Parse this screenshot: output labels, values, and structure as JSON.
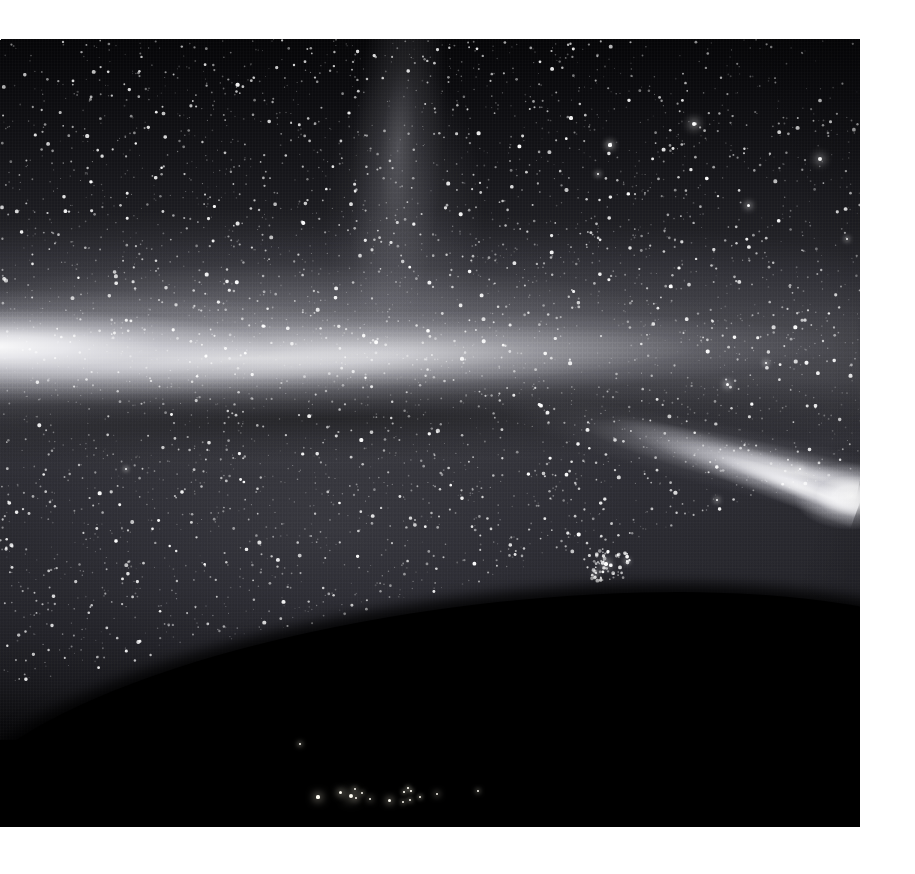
{
  "page": {
    "width": 915,
    "height": 874,
    "background": "#ffffff"
  },
  "photo": {
    "name": "all-sky-night-exposure",
    "x": 0,
    "y": 39,
    "width": 860,
    "height": 788,
    "alt_text": "Wide-angle all-sky night exposure showing the Milky Way band, airglow and a dark curved horizon with distant ground lights",
    "palette": {
      "paper": "#ffffff",
      "sky_zenith": "#050507",
      "sky_mid": "#2b2b31",
      "band_core": "#fafafc",
      "band_mid": "#c4c4ca",
      "dark_lane": "#14141a",
      "ground": "#000000",
      "star": "#ffffff",
      "ground_light": "#fffdf4"
    }
  },
  "features": [
    {
      "name": "milky-way-band",
      "label": "Milky Way luminous band",
      "description": "Broad bright band sweeping from the left edge across the frame and converging toward the right edge",
      "center_x_pct": 28,
      "center_y_pct": 40,
      "tilt_deg": -1.4
    },
    {
      "name": "milky-way-right-arm",
      "label": "Converging right arm",
      "description": "Narrow luminous arm descending toward a bright knot at the right edge",
      "center_x_pct": 92,
      "center_y_pct": 55,
      "tilt_deg": 13
    },
    {
      "name": "galactic-spur",
      "label": "Faint vertical galactic spur",
      "description": "Dim vertical extension of diffuse light rising toward the top of the frame",
      "center_x_pct": 44,
      "center_y_pct": 14
    },
    {
      "name": "dark-dust-lane",
      "label": "Dark dust lane",
      "description": "Darker band immediately below the bright core",
      "center_x_pct": 38,
      "center_y_pct": 48
    },
    {
      "name": "horizon-curve",
      "label": "Curved dark horizon",
      "description": "Black foreground terrain curving upward to the right, occluding the lower sky",
      "tilt_deg": -7.2
    },
    {
      "name": "star-cluster",
      "label": "Open star cluster",
      "description": "Compact knot of stars in the lower-middle sky",
      "center_x": 606,
      "center_y": 525
    }
  ],
  "bright_stars": [
    {
      "x": 694,
      "y": 85,
      "size": 4.5,
      "glow": 9
    },
    {
      "x": 820,
      "y": 120,
      "size": 4.0,
      "glow": 8
    },
    {
      "x": 748,
      "y": 166,
      "size": 3.0,
      "glow": 6
    },
    {
      "x": 610,
      "y": 106,
      "size": 3.2,
      "glow": 6
    },
    {
      "x": 847,
      "y": 200,
      "size": 2.6,
      "glow": 5
    },
    {
      "x": 598,
      "y": 135,
      "size": 2.4,
      "glow": 5
    },
    {
      "x": 727,
      "y": 345,
      "size": 3.0,
      "glow": 6
    },
    {
      "x": 766,
      "y": 324,
      "size": 2.6,
      "glow": 5
    },
    {
      "x": 800,
      "y": 430,
      "size": 2.8,
      "glow": 6
    },
    {
      "x": 717,
      "y": 461,
      "size": 2.6,
      "glow": 5
    },
    {
      "x": 606,
      "y": 525,
      "size": 3.4,
      "glow": 7
    },
    {
      "x": 627,
      "y": 522,
      "size": 2.4,
      "glow": 5
    },
    {
      "x": 596,
      "y": 534,
      "size": 2.4,
      "glow": 5
    },
    {
      "x": 556,
      "y": 600,
      "size": 2.4,
      "glow": 5
    },
    {
      "x": 684,
      "y": 574,
      "size": 2.2,
      "glow": 4
    },
    {
      "x": 742,
      "y": 586,
      "size": 2.2,
      "glow": 4
    },
    {
      "x": 287,
      "y": 648,
      "size": 2.0,
      "glow": 4
    },
    {
      "x": 126,
      "y": 430,
      "size": 2.2,
      "glow": 4
    },
    {
      "x": 196,
      "y": 700,
      "size": 2.0,
      "glow": 4
    },
    {
      "x": 400,
      "y": 743,
      "size": 2.2,
      "glow": 5
    },
    {
      "x": 303,
      "y": 743,
      "size": 2.0,
      "glow": 4
    }
  ],
  "ground_lights": [
    {
      "x": 318,
      "y": 797,
      "size": 3.2
    },
    {
      "x": 340,
      "y": 792,
      "size": 3.0
    },
    {
      "x": 351,
      "y": 796,
      "size": 4.0
    },
    {
      "x": 356,
      "y": 798,
      "size": 2.4
    },
    {
      "x": 362,
      "y": 793,
      "size": 2.0
    },
    {
      "x": 370,
      "y": 799,
      "size": 2.6
    },
    {
      "x": 389,
      "y": 800,
      "size": 3.0
    },
    {
      "x": 403,
      "y": 802,
      "size": 2.0
    },
    {
      "x": 410,
      "y": 800,
      "size": 2.2
    },
    {
      "x": 420,
      "y": 797,
      "size": 1.8
    },
    {
      "x": 408,
      "y": 788,
      "size": 1.6
    },
    {
      "x": 404,
      "y": 792,
      "size": 1.6
    },
    {
      "x": 411,
      "y": 791,
      "size": 1.6
    },
    {
      "x": 355,
      "y": 789,
      "size": 2.0
    },
    {
      "x": 437,
      "y": 794,
      "size": 2.4
    },
    {
      "x": 300,
      "y": 744,
      "size": 2.2
    },
    {
      "x": 478,
      "y": 791,
      "size": 2.0
    }
  ],
  "overlays": {
    "has_text_labels": false,
    "has_axes": false,
    "has_timestamp": false
  }
}
